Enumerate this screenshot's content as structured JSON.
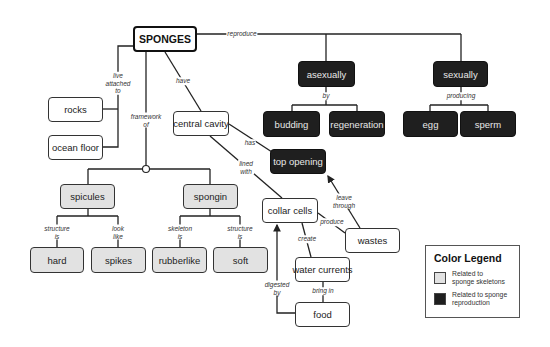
{
  "title": "SPONGES",
  "nodes": {
    "sponges": "SPONGES",
    "rocks": "rocks",
    "ocean_floor": "ocean floor",
    "central_cavity": "central cavity",
    "top_opening": "top opening",
    "asexually": "asexually",
    "sexually": "sexually",
    "budding": "budding",
    "regeneration": "regeneration",
    "egg": "egg",
    "sperm": "sperm",
    "spicules": "spicules",
    "spongin": "spongin",
    "hard": "hard",
    "spikes": "spikes",
    "rubberlike": "rubberlike",
    "soft": "soft",
    "collar_cells": "collar cells",
    "wastes": "wastes",
    "water_currents": "water currents",
    "food": "food"
  },
  "links": {
    "reproduce": "reproduce",
    "live_attached_to": "live\nattached\nto",
    "have": "have",
    "framework_of": "framework\nof",
    "has": "has",
    "lined_with": "lined\nwith",
    "by": "by",
    "producing": "producing",
    "structure_is_1": "structure\nis",
    "look_like": "look\nlike",
    "skeleton_is": "skeleton\nis",
    "structure_is_2": "structure\nis",
    "leave_through": "leave\nthrough",
    "produce": "produce",
    "create": "create",
    "bring_in": "bring in",
    "digested_by": "digested\nby"
  },
  "legend": {
    "title": "Color Legend",
    "items": [
      {
        "label": "Related to\nsponge skeletons",
        "color": "#e2e2e2"
      },
      {
        "label": "Related to sponge\nreproduction",
        "color": "#1f1f1f"
      }
    ]
  },
  "colors": {
    "skeleton_fill": "#e2e2e2",
    "reproduction_fill": "#1f1f1f",
    "line": "#222222"
  }
}
